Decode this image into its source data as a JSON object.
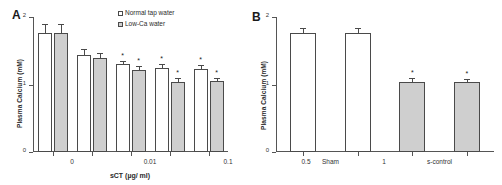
{
  "figure": {
    "panel_a_letter": "A",
    "panel_b_letter": "B"
  },
  "chart_data": [
    {
      "type": "bar",
      "panel": "A",
      "title": "",
      "xlabel": "sCT (µg/ ml)",
      "ylabel": "Plasma Calcium (mM)",
      "categories": [
        "0",
        "0.01",
        "0.1",
        "0.5",
        "1"
      ],
      "ylim": [
        0,
        2
      ],
      "yticks": [
        "0",
        "1",
        "2"
      ],
      "grid": false,
      "legend_position": "top-right",
      "series": [
        {
          "name": "Normal tap water",
          "fill": "open",
          "values": [
            1.77,
            1.43,
            1.3,
            1.24,
            1.23
          ],
          "errors": [
            0.13,
            0.09,
            0.05,
            0.06,
            0.06
          ],
          "significance": [
            "",
            "",
            "*",
            "*",
            "*"
          ]
        },
        {
          "name": "Low-Ca water",
          "fill": "shaded",
          "values": [
            1.76,
            1.39,
            1.22,
            1.04,
            1.05
          ],
          "errors": [
            0.13,
            0.08,
            0.05,
            0.05,
            0.05
          ],
          "significance": [
            "",
            "",
            "*",
            "*",
            "*"
          ]
        }
      ]
    },
    {
      "type": "bar",
      "panel": "B",
      "title": "",
      "xlabel": "",
      "ylabel": "Plasma Calcium (mM)",
      "categories": [
        "Sham",
        "s-control",
        "sCT-repeated dose",
        "sCT-single dose"
      ],
      "ylim": [
        0,
        2
      ],
      "yticks": [
        "0",
        "1",
        "2"
      ],
      "grid": false,
      "legend_position": "none",
      "series": [
        {
          "name": "Plasma Calcium",
          "fills": [
            "open",
            "open",
            "shaded",
            "shaded"
          ],
          "values": [
            1.77,
            1.76,
            1.04,
            1.03
          ],
          "errors": [
            0.07,
            0.08,
            0.05,
            0.05
          ],
          "significance": [
            "",
            "",
            "*",
            "*"
          ]
        }
      ]
    }
  ]
}
